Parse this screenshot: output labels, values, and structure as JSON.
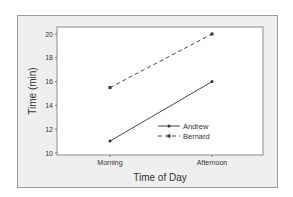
{
  "chart_data": {
    "type": "line",
    "title": "",
    "xlabel": "Time of Day",
    "ylabel": "Time (min)",
    "categories": [
      "Morning",
      "Afternoon"
    ],
    "series": [
      {
        "name": "Andrew",
        "values": [
          11,
          16
        ],
        "line_style": "solid",
        "marker": "dot"
      },
      {
        "name": "Bernard",
        "values": [
          15.5,
          20
        ],
        "line_style": "dashed",
        "marker": "square"
      }
    ],
    "ylim": [
      10,
      20
    ],
    "yticks": [
      10,
      12,
      14,
      16,
      18,
      20
    ],
    "grid": false,
    "legend_position": "lower right inside plot"
  },
  "colors": {
    "panel_background": "#efefef",
    "plot_background": "#ffffff",
    "line": "#333333"
  }
}
